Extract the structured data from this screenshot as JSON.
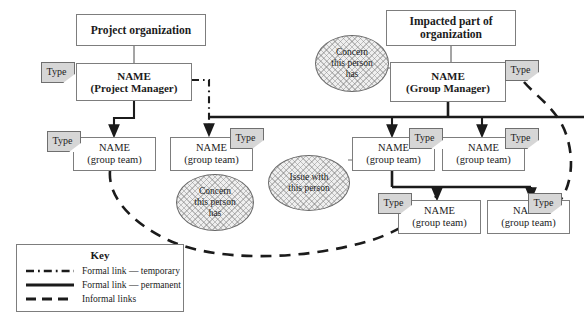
{
  "diagram": {
    "colors": {
      "node_border": "#7d7d7d",
      "node_fill": "#ffffff",
      "note_fill": "#d6d6d6",
      "note_border": "#6f6f6f",
      "bubble_fill": "#efefef",
      "bubble_border": "#6a6a6a",
      "line": "#1b1b1b",
      "background": "#ffffff"
    }
  },
  "headers": [
    {
      "id": "project-organization",
      "label": "Project organization",
      "x": 76,
      "y": 14,
      "w": 130,
      "h": 32
    },
    {
      "id": "impacted-part",
      "line1": "Impacted part of",
      "line2": "organization",
      "x": 386,
      "y": 10,
      "w": 130,
      "h": 36
    }
  ],
  "managers": [
    {
      "id": "project-manager",
      "line1": "NAME",
      "line2": "(Project Manager)",
      "x": 76,
      "y": 63,
      "w": 116,
      "h": 38,
      "note": {
        "label": "Type",
        "x": 41,
        "y": 62
      }
    },
    {
      "id": "group-manager",
      "line1": "NAME",
      "line2": "(Group Manager)",
      "x": 390,
      "y": 62,
      "w": 116,
      "h": 40,
      "note": {
        "label": "Type",
        "x": 505,
        "y": 60
      }
    }
  ],
  "teams": [
    {
      "id": "team-1",
      "line1": "NAME",
      "line2": "(group team)",
      "x": 73,
      "y": 137,
      "w": 83,
      "h": 34,
      "note": {
        "label": "Type",
        "x": 47,
        "y": 131
      }
    },
    {
      "id": "team-2",
      "line1": "NAME",
      "line2": "(group team)",
      "x": 170,
      "y": 137,
      "w": 83,
      "h": 34,
      "note": {
        "label": "Type",
        "x": 230,
        "y": 128
      }
    },
    {
      "id": "team-3",
      "line1": "NAME",
      "line2": "(group team)",
      "x": 352,
      "y": 137,
      "w": 83,
      "h": 34,
      "note": {
        "label": "Type",
        "x": 409,
        "y": 128
      }
    },
    {
      "id": "team-4",
      "line1": "NAME",
      "line2": "(group team)",
      "x": 442,
      "y": 137,
      "w": 83,
      "h": 34,
      "note": {
        "label": "Type",
        "x": 505,
        "y": 128
      }
    },
    {
      "id": "team-5",
      "line1": "NAME",
      "line2": "(group team)",
      "x": 398,
      "y": 200,
      "w": 83,
      "h": 34,
      "note": {
        "label": "Type",
        "x": 378,
        "y": 193
      }
    },
    {
      "id": "team-6",
      "line1": "NAME",
      "line2": "(group team)",
      "x": 487,
      "y": 200,
      "w": 83,
      "h": 34,
      "note": {
        "label": "Type",
        "x": 528,
        "y": 193
      }
    }
  ],
  "bubbles": [
    {
      "id": "concern-top",
      "lines": [
        "Concern",
        "this person",
        "has"
      ],
      "x": 315,
      "y": 35,
      "w": 72,
      "h": 55
    },
    {
      "id": "concern-bottom",
      "lines": [
        "Concern",
        "this person",
        "has"
      ],
      "x": 176,
      "y": 174,
      "w": 76,
      "h": 55
    },
    {
      "id": "issue-with-person",
      "lines": [
        "Issue with",
        "this person"
      ],
      "x": 268,
      "y": 155,
      "w": 80,
      "h": 54
    }
  ],
  "key": {
    "title": "Key",
    "rows": [
      {
        "id": "formal-temporary",
        "style": "dash-dot",
        "label": "Formal link — temporary"
      },
      {
        "id": "formal-permanent",
        "style": "solid",
        "label": "Formal link — permanent"
      },
      {
        "id": "informal",
        "style": "dashed",
        "label": "Informal links"
      }
    ]
  }
}
